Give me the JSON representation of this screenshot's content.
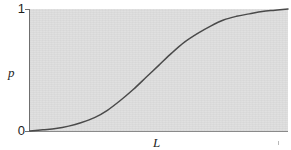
{
  "figure": {
    "background_color": "#ffffff",
    "plot_fill_color": "#dedede",
    "axis_color": "#6f6f6f",
    "curve_color": "#4a4a4a"
  },
  "axes": {
    "y_label": "p",
    "x_label": "L",
    "y_ticks": [
      {
        "value": "1",
        "name": "y-tick-top"
      },
      {
        "value": "0",
        "name": "y-tick-bottom"
      }
    ],
    "x_ticks": []
  },
  "chart_data": {
    "type": "line",
    "title": "",
    "subtitle": "",
    "xlabel": "L",
    "ylabel": "p",
    "xlim": [
      0,
      1
    ],
    "ylim": [
      0,
      1
    ],
    "grid": false,
    "legend": null,
    "tick_labels": {
      "y": [
        "0",
        "1"
      ],
      "x": []
    },
    "annotations": [],
    "series": [
      {
        "name": "sigmoid",
        "x": [
          0.0,
          0.05,
          0.1,
          0.15,
          0.2,
          0.25,
          0.3,
          0.35,
          0.4,
          0.45,
          0.5,
          0.55,
          0.6,
          0.65,
          0.7,
          0.75,
          0.8,
          0.85,
          0.9,
          0.95,
          1.0
        ],
        "y": [
          0.0,
          0.01,
          0.02,
          0.04,
          0.07,
          0.11,
          0.17,
          0.25,
          0.34,
          0.44,
          0.54,
          0.64,
          0.73,
          0.8,
          0.86,
          0.91,
          0.94,
          0.96,
          0.98,
          0.99,
          1.0
        ]
      }
    ]
  },
  "geometry": {
    "plot_left_px": 30,
    "plot_top_px": 9,
    "plot_width_px": 258,
    "plot_height_px": 122
  }
}
